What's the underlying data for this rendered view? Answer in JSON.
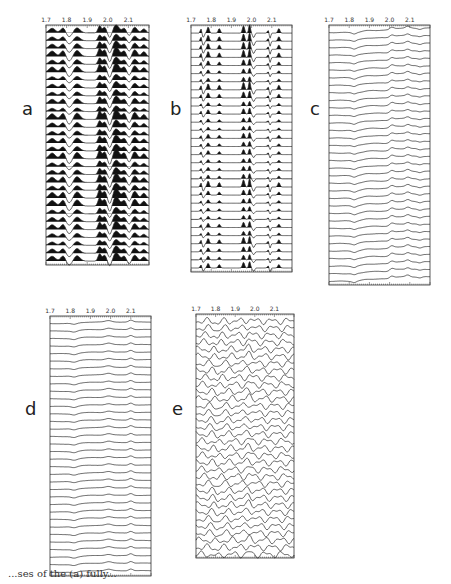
{
  "figure": {
    "panels": [
      {
        "id": "a",
        "label": "a",
        "style": "filled-peaks",
        "x": 46,
        "y": 25,
        "w": 103,
        "h": 240,
        "traces": 30,
        "label_x": 22,
        "label_y": 100
      },
      {
        "id": "b",
        "label": "b",
        "style": "sharp-spikes",
        "x": 191,
        "y": 25,
        "w": 101,
        "h": 247,
        "traces": 30,
        "label_x": 170,
        "label_y": 100
      },
      {
        "id": "c",
        "label": "c",
        "style": "smooth-steps",
        "x": 329,
        "y": 25,
        "w": 101,
        "h": 260,
        "traces": 34,
        "label_x": 310,
        "label_y": 100
      },
      {
        "id": "d",
        "label": "d",
        "style": "flat-smooth",
        "x": 50,
        "y": 316,
        "w": 101,
        "h": 260,
        "traces": 34,
        "label_x": 25,
        "label_y": 400
      },
      {
        "id": "e",
        "label": "e",
        "style": "wavy",
        "x": 196,
        "y": 314,
        "w": 98,
        "h": 244,
        "traces": 34,
        "label_x": 172,
        "label_y": 400
      }
    ],
    "axis_ticks": [
      "1.7",
      "1.8",
      "1.9",
      "2.0",
      "2.1"
    ],
    "caption_fragment": "...ses of the (a) fully..."
  },
  "chart_data": [
    {
      "type": "line",
      "title": "a",
      "xlabel": "",
      "ylabel": "",
      "x_ticks": [
        "1.7",
        "1.8",
        "1.9",
        "2.0",
        "2.1"
      ],
      "xlim": [
        1.7,
        2.2
      ],
      "description": "Stacked traces with filled (black) peaks; dominant peaks near 1.8, 1.95, 2.0, 2.05, 2.1"
    },
    {
      "type": "line",
      "title": "b",
      "xlabel": "",
      "ylabel": "",
      "x_ticks": [
        "1.7",
        "1.8",
        "1.9",
        "2.0",
        "2.1"
      ],
      "xlim": [
        1.7,
        2.2
      ],
      "description": "Stacked traces with sharp narrow spikes near 1.8, 1.95, 2.0 and dips near 2.05"
    },
    {
      "type": "line",
      "title": "c",
      "xlabel": "",
      "ylabel": "",
      "x_ticks": [
        "1.7",
        "1.8",
        "1.9",
        "2.0",
        "2.1"
      ],
      "xlim": [
        1.7,
        2.2
      ],
      "description": "Stacked smooth traces with step rise near 1.85 and bumps near 2.0 and 2.1"
    },
    {
      "type": "line",
      "title": "d",
      "xlabel": "",
      "ylabel": "",
      "x_ticks": [
        "1.7",
        "1.8",
        "1.9",
        "2.0",
        "2.1"
      ],
      "xlim": [
        1.7,
        2.2
      ],
      "description": "Stacked nearly flat traces with small bumps near 1.8 and 2.05"
    },
    {
      "type": "line",
      "title": "e",
      "xlabel": "",
      "ylabel": "",
      "x_ticks": [
        "1.7",
        "1.8",
        "1.9",
        "2.0",
        "2.1"
      ],
      "xlim": [
        1.7,
        2.2
      ],
      "description": "Stacked strongly oscillating traces"
    }
  ]
}
